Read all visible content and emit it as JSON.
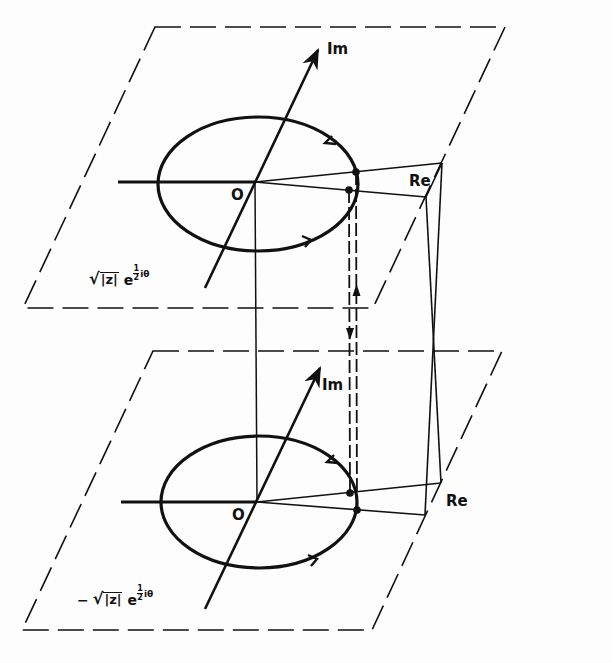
{
  "figure": {
    "upper_plane": {
      "axis_labels": {
        "imaginary": "Im",
        "real": "Re"
      },
      "origin_label": "O",
      "formula": {
        "prefix": "",
        "radical": "|z|",
        "base": "e",
        "frac_num": "1",
        "frac_den": "2",
        "tail": "iθ"
      },
      "contour_direction": "counterclockwise",
      "marked_points": 2
    },
    "lower_plane": {
      "axis_labels": {
        "imaginary": "Im",
        "real": "Re"
      },
      "origin_label": "O",
      "formula": {
        "prefix": "−",
        "radical": "|z|",
        "base": "e",
        "frac_num": "1",
        "frac_den": "2",
        "tail": "iθ"
      },
      "contour_direction": "counterclockwise",
      "marked_points": 2
    },
    "connectors": {
      "branch_cut_transition": "dashed double vertical line with up and down arrows",
      "origin_link": "vertical line joining origins",
      "real_axis_link": "crossed vertical lines joining Re corners"
    },
    "colors": {
      "ink": "#111111",
      "paper": "#fdfdfd"
    }
  }
}
